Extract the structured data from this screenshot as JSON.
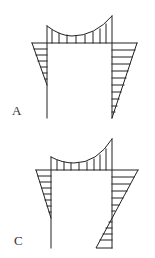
{
  "figures": [
    {
      "label": "A",
      "description": "Bending moment diagram of portal frame; both column diagrams drawn on outer side, right-column triangle reaches zero at base"
    },
    {
      "label": "C",
      "description": "Bending moment diagram of portal frame; right column diagram changes sign along its height"
    }
  ],
  "colors": {
    "line": "#222222",
    "text": "#333333",
    "background": "#ffffff"
  }
}
